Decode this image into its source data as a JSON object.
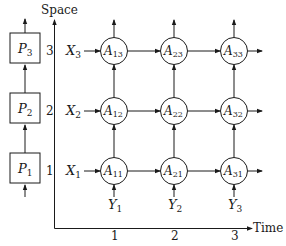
{
  "axes": {
    "y_label": "Space",
    "x_label": "Time",
    "y_ticks": [
      "1",
      "2",
      "3"
    ],
    "x_ticks": [
      "1",
      "2",
      "3"
    ]
  },
  "processors": [
    {
      "name": "P",
      "sub": "1"
    },
    {
      "name": "P",
      "sub": "2"
    },
    {
      "name": "P",
      "sub": "3"
    }
  ],
  "row_inputs": [
    {
      "name": "X",
      "sub": "1"
    },
    {
      "name": "X",
      "sub": "2"
    },
    {
      "name": "X",
      "sub": "3"
    }
  ],
  "col_inputs": [
    {
      "name": "Y",
      "sub": "1"
    },
    {
      "name": "Y",
      "sub": "2"
    },
    {
      "name": "Y",
      "sub": "3"
    }
  ],
  "nodes": {
    "A11": {
      "name": "A",
      "sub": "11"
    },
    "A21": {
      "name": "A",
      "sub": "21"
    },
    "A31": {
      "name": "A",
      "sub": "31"
    },
    "A12": {
      "name": "A",
      "sub": "12"
    },
    "A22": {
      "name": "A",
      "sub": "22"
    },
    "A32": {
      "name": "A",
      "sub": "32"
    },
    "A13": {
      "name": "A",
      "sub": "13"
    },
    "A23": {
      "name": "A",
      "sub": "23"
    },
    "A33": {
      "name": "A",
      "sub": "33"
    }
  },
  "colors": {
    "stroke": "#1a1a1a",
    "background": "#ffffff"
  }
}
